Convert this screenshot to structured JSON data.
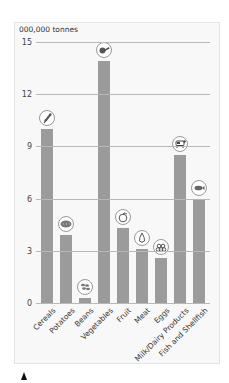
{
  "chart_data": {
    "type": "bar",
    "title": "",
    "ylabel": "000,000 tonnes",
    "xlabel": "",
    "ylim": [
      0,
      15
    ],
    "yticks": [
      0,
      3,
      6,
      9,
      12,
      15
    ],
    "grid": true,
    "legend": null,
    "categories": [
      "Cereals",
      "Potatoes",
      "Beans",
      "Vegetables",
      "Fruit",
      "Meat",
      "Eggs",
      "Milk/Dairy Products",
      "Fish and Shellfish"
    ],
    "values": [
      10.0,
      3.9,
      0.3,
      13.9,
      4.3,
      3.1,
      2.6,
      8.5,
      6.0
    ],
    "icons": [
      "wheat-icon",
      "bread-icon",
      "beans-icon",
      "vegetable-icon",
      "apple-icon",
      "meat-icon",
      "eggs-icon",
      "cow-icon",
      "fish-icon"
    ],
    "bar_color": "#9b9b9b"
  },
  "axis": {
    "unit_label": "000,000 tonnes",
    "ticks": [
      "0",
      "3",
      "6",
      "9",
      "12",
      "15"
    ]
  }
}
